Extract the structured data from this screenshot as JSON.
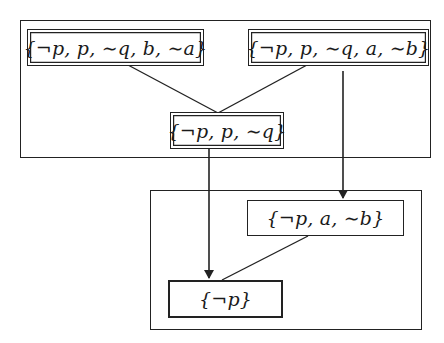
{
  "diagram": {
    "type": "set-refinement-graph",
    "groups": [
      {
        "id": "upper-group",
        "label": ""
      },
      {
        "id": "lower-group",
        "label": ""
      }
    ],
    "nodes": [
      {
        "id": "n1",
        "label": "{¬p, p, ∼q, b, ∼a}",
        "group": "upper-group"
      },
      {
        "id": "n2",
        "label": "{¬p, p, ∼q, a, ∼b}",
        "group": "upper-group"
      },
      {
        "id": "n3",
        "label": "{¬p, p, ∼q}",
        "group": "upper-group"
      },
      {
        "id": "n4",
        "label": "{¬p, a, ∼b}",
        "group": "lower-group"
      },
      {
        "id": "n5",
        "label": "{¬p}",
        "group": "lower-group"
      }
    ],
    "edges": [
      {
        "from": "n1",
        "to": "n3",
        "style": "line"
      },
      {
        "from": "n2",
        "to": "n3",
        "style": "line"
      },
      {
        "from": "n2",
        "to": "n4",
        "style": "arrow"
      },
      {
        "from": "n3",
        "to": "n5",
        "style": "arrow"
      },
      {
        "from": "n4",
        "to": "n5",
        "style": "line"
      }
    ],
    "colors": {
      "stroke": "#222222",
      "background": "#ffffff"
    }
  }
}
